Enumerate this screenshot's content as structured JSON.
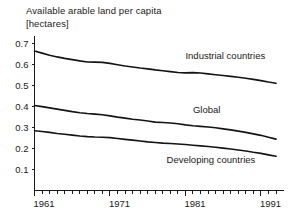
{
  "chart_data": {
    "type": "line",
    "title": "Available arable land per capita",
    "subtitle": "[hectares]",
    "xlabel": "",
    "ylabel": "",
    "unit": "hectares",
    "grid": false,
    "legend_position": "inline",
    "xlim": [
      1961,
      1993
    ],
    "ylim": [
      0.0,
      0.72
    ],
    "yticks": [
      0.1,
      0.2,
      0.3,
      0.4,
      0.5,
      0.6,
      0.7
    ],
    "ytick_labels": [
      "0.1",
      "0.2",
      "0.3",
      "0.4",
      "0.5",
      "0.6",
      "0.7"
    ],
    "xticks_major": [
      1961,
      1971,
      1981,
      1991
    ],
    "xtick_labels": [
      "1961",
      "1971",
      "1981",
      "1991"
    ],
    "xticks_minor_step": 1,
    "x": [
      1961,
      1962,
      1963,
      1964,
      1965,
      1966,
      1967,
      1968,
      1969,
      1970,
      1971,
      1972,
      1973,
      1974,
      1975,
      1976,
      1977,
      1978,
      1979,
      1980,
      1981,
      1982,
      1983,
      1984,
      1985,
      1986,
      1987,
      1988,
      1989,
      1990,
      1991,
      1992,
      1993
    ],
    "series": [
      {
        "name": "Industrial countries",
        "label": "Industrial countries",
        "color": "#141414",
        "values": [
          0.665,
          0.655,
          0.645,
          0.637,
          0.63,
          0.624,
          0.618,
          0.613,
          0.612,
          0.611,
          0.606,
          0.6,
          0.594,
          0.589,
          0.584,
          0.58,
          0.575,
          0.571,
          0.567,
          0.563,
          0.561,
          0.562,
          0.56,
          0.556,
          0.552,
          0.548,
          0.544,
          0.54,
          0.535,
          0.53,
          0.524,
          0.517,
          0.511
        ]
      },
      {
        "name": "Global",
        "label": "Global",
        "color": "#141414",
        "values": [
          0.405,
          0.4,
          0.394,
          0.388,
          0.382,
          0.376,
          0.371,
          0.367,
          0.364,
          0.361,
          0.356,
          0.35,
          0.345,
          0.34,
          0.336,
          0.331,
          0.326,
          0.324,
          0.322,
          0.318,
          0.313,
          0.309,
          0.306,
          0.303,
          0.299,
          0.294,
          0.289,
          0.283,
          0.277,
          0.27,
          0.263,
          0.254,
          0.245
        ]
      },
      {
        "name": "Developing countries",
        "label": "Developing countries",
        "color": "#141414",
        "values": [
          0.285,
          0.281,
          0.277,
          0.272,
          0.268,
          0.264,
          0.26,
          0.257,
          0.255,
          0.254,
          0.252,
          0.248,
          0.244,
          0.24,
          0.236,
          0.232,
          0.229,
          0.226,
          0.224,
          0.222,
          0.219,
          0.216,
          0.213,
          0.21,
          0.206,
          0.202,
          0.198,
          0.193,
          0.188,
          0.182,
          0.177,
          0.17,
          0.163
        ]
      }
    ],
    "annotations": [
      {
        "text": "Industrial countries",
        "x": 1981.0,
        "y": 0.625
      },
      {
        "text": "Global",
        "x": 1982.0,
        "y": 0.368
      },
      {
        "text": "Developing countries",
        "x": 1978.5,
        "y": 0.133
      }
    ]
  }
}
